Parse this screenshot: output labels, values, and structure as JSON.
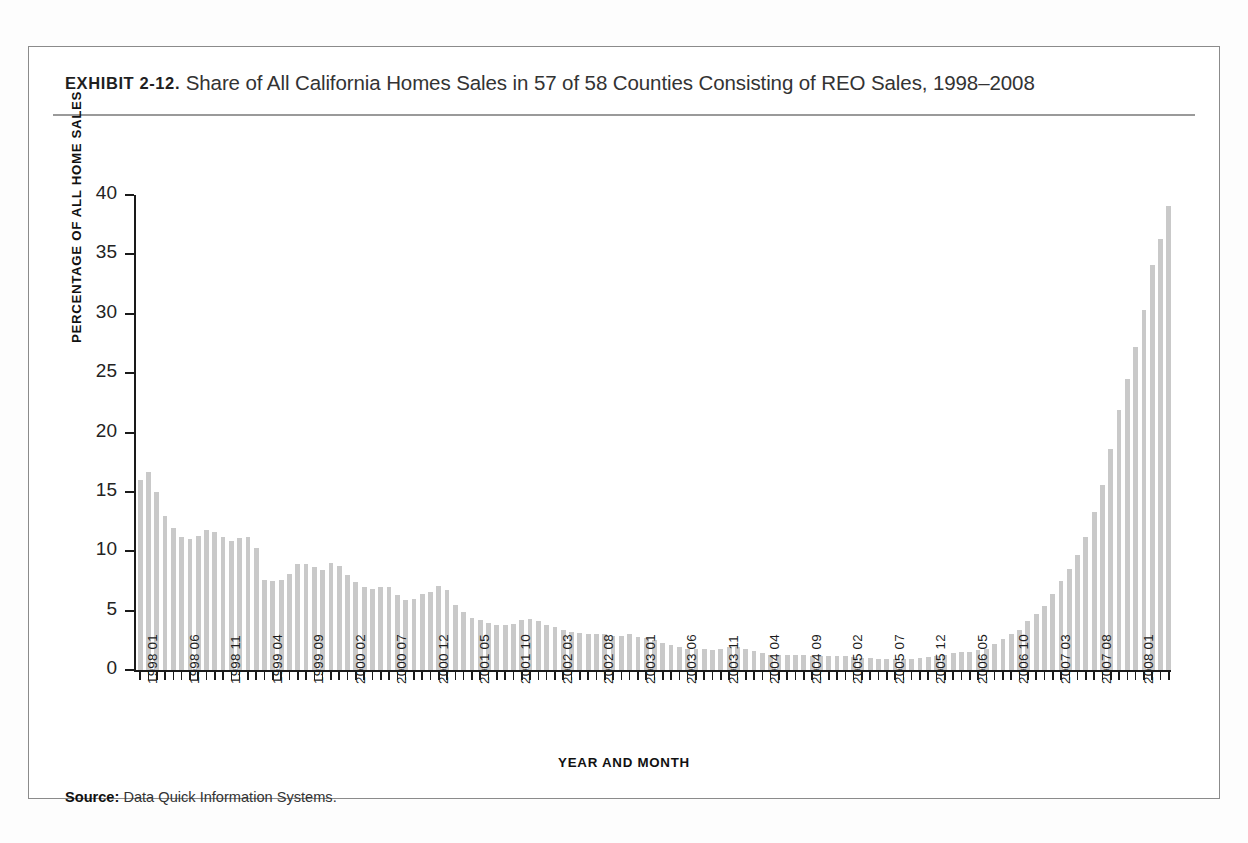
{
  "exhibit": {
    "label": "EXHIBIT 2-12.",
    "caption": "Share of All California Homes Sales in 57 of 58 Counties Consisting of REO Sales, 1998–2008",
    "source_label": "Source:",
    "source_text": "Data Quick Information Systems."
  },
  "colors": {
    "bar": "#c9c9c9",
    "axis": "#1a1a1a",
    "frame": "#8b8b8b",
    "rule": "#9a9a9a",
    "text": "#232323"
  },
  "chart_data": {
    "type": "bar",
    "title": "Share of All California Homes Sales in 57 of 58 Counties Consisting of REO Sales, 1998–2008",
    "xlabel": "YEAR AND MONTH",
    "ylabel": "PERCENTAGE OF ALL HOME SALES",
    "ylim": [
      0,
      40
    ],
    "yticks": [
      0,
      5,
      10,
      15,
      20,
      25,
      30,
      35,
      40
    ],
    "grid": false,
    "legend": null,
    "xtick_labels": [
      "1998 01",
      "1998 06",
      "1998 11",
      "1999 04",
      "1999 09",
      "2000 02",
      "2000 07",
      "2000 12",
      "2001 05",
      "2001 10",
      "2002 03",
      "2002 08",
      "2003 01",
      "2003 06",
      "2003 11",
      "2004 04",
      "2004 09",
      "2005 02",
      "2005 07",
      "2005 12",
      "2006 05",
      "2006 10",
      "2007 03",
      "2007 08",
      "2008 01"
    ],
    "xtick_every": 5,
    "categories": [
      "1998 01",
      "1998 02",
      "1998 03",
      "1998 04",
      "1998 05",
      "1998 06",
      "1998 07",
      "1998 08",
      "1998 09",
      "1998 10",
      "1998 11",
      "1998 12",
      "1999 01",
      "1999 02",
      "1999 03",
      "1999 04",
      "1999 05",
      "1999 06",
      "1999 07",
      "1999 08",
      "1999 09",
      "1999 10",
      "1999 11",
      "1999 12",
      "2000 01",
      "2000 02",
      "2000 03",
      "2000 04",
      "2000 05",
      "2000 06",
      "2000 07",
      "2000 08",
      "2000 09",
      "2000 10",
      "2000 11",
      "2000 12",
      "2001 01",
      "2001 02",
      "2001 03",
      "2001 04",
      "2001 05",
      "2001 06",
      "2001 07",
      "2001 08",
      "2001 09",
      "2001 10",
      "2001 11",
      "2001 12",
      "2002 01",
      "2002 02",
      "2002 03",
      "2002 04",
      "2002 05",
      "2002 06",
      "2002 07",
      "2002 08",
      "2002 09",
      "2002 10",
      "2002 11",
      "2002 12",
      "2003 01",
      "2003 02",
      "2003 03",
      "2003 04",
      "2003 05",
      "2003 06",
      "2003 07",
      "2003 08",
      "2003 09",
      "2003 10",
      "2003 11",
      "2003 12",
      "2004 01",
      "2004 02",
      "2004 03",
      "2004 04",
      "2004 05",
      "2004 06",
      "2004 07",
      "2004 08",
      "2004 09",
      "2004 10",
      "2004 11",
      "2004 12",
      "2005 01",
      "2005 02",
      "2005 03",
      "2005 04",
      "2005 05",
      "2005 06",
      "2005 07",
      "2005 08",
      "2005 09",
      "2005 10",
      "2005 11",
      "2005 12",
      "2006 01",
      "2006 02",
      "2006 03",
      "2006 04",
      "2006 05",
      "2006 06",
      "2006 07",
      "2006 08",
      "2006 09",
      "2006 10",
      "2006 11",
      "2006 12",
      "2007 01",
      "2007 02",
      "2007 03",
      "2007 04",
      "2007 05",
      "2007 06",
      "2007 07",
      "2007 08",
      "2007 09",
      "2007 10",
      "2007 11",
      "2007 12",
      "2008 01",
      "2008 02",
      "2008 03",
      "2008 04",
      "2008 05"
    ],
    "values": [
      16.0,
      16.7,
      15.0,
      13.0,
      12.0,
      11.2,
      11.0,
      11.3,
      11.8,
      11.6,
      11.2,
      10.9,
      11.1,
      11.2,
      10.3,
      7.6,
      7.5,
      7.6,
      8.1,
      8.9,
      8.9,
      8.7,
      8.4,
      9.0,
      8.8,
      8.0,
      7.4,
      7.0,
      6.8,
      7.0,
      7.0,
      6.3,
      5.9,
      6.0,
      6.4,
      6.6,
      7.1,
      6.7,
      5.5,
      4.9,
      4.4,
      4.2,
      4.0,
      3.8,
      3.8,
      3.9,
      4.2,
      4.3,
      4.1,
      3.8,
      3.6,
      3.4,
      3.2,
      3.1,
      3.0,
      3.0,
      3.0,
      2.9,
      2.9,
      3.0,
      2.8,
      2.7,
      2.5,
      2.3,
      2.1,
      1.9,
      1.8,
      1.8,
      1.8,
      1.7,
      1.8,
      1.9,
      1.9,
      1.8,
      1.6,
      1.4,
      1.3,
      1.3,
      1.3,
      1.3,
      1.3,
      1.2,
      1.2,
      1.2,
      1.2,
      1.2,
      1.1,
      1.0,
      1.0,
      0.9,
      0.9,
      0.9,
      0.9,
      0.9,
      1.0,
      1.1,
      1.2,
      1.3,
      1.4,
      1.5,
      1.5,
      1.7,
      1.8,
      2.2,
      2.6,
      3.0,
      3.4,
      4.1,
      4.7,
      5.4,
      6.4,
      7.5,
      8.5,
      9.7,
      11.2,
      13.3,
      15.6,
      18.6,
      21.9,
      24.5,
      27.2,
      30.3,
      34.1,
      36.3,
      39.1
    ]
  }
}
